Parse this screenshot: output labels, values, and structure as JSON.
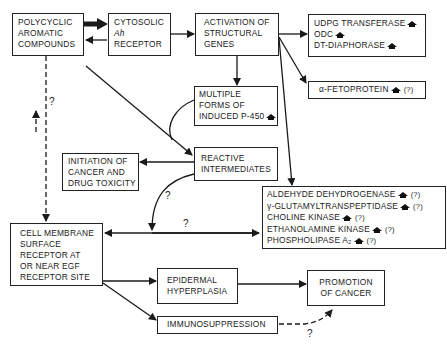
{
  "diagram": {
    "nodes": {
      "pah": {
        "lines": [
          "POLYCYCLIC",
          "AROMATIC",
          "COMPOUNDS"
        ]
      },
      "ah_receptor": {
        "lines": [
          "CYTOSOLIC",
          "Ah",
          "RECEPTOR"
        ]
      },
      "activation": {
        "lines": [
          "ACTIVATION OF",
          "STRUCTURAL",
          "GENES"
        ]
      },
      "enzymes": {
        "items": [
          {
            "label": "UDPG TRANSFERASE",
            "indicator": "increase",
            "note": ""
          },
          {
            "label": "ODC",
            "indicator": "increase",
            "note": ""
          },
          {
            "label": "DT-DIAPHORASE",
            "indicator": "increase",
            "note": ""
          }
        ]
      },
      "afp": {
        "label": "α-FETOPROTEIN",
        "indicator": "increase",
        "note": "(?)"
      },
      "p450": {
        "lines": [
          "MULTIPLE",
          "FORMS OF",
          "INDUCED P-450"
        ],
        "indicator": "increase"
      },
      "reactive": {
        "lines": [
          "REACTIVE",
          "INTERMEDIATES"
        ]
      },
      "initiation": {
        "lines": [
          "INITIATION OF",
          "CANCER AND",
          "DRUG TOXICITY"
        ]
      },
      "enzymes2": {
        "items": [
          {
            "label": "ALDEHYDE DEHYDROGENASE",
            "note": "(?)"
          },
          {
            "label": "γ-GLUTAMYLTRANSPEPTIDASE",
            "note": "(?)"
          },
          {
            "label": "CHOLINE KINASE",
            "note": "(?)"
          },
          {
            "label": "ETHANOLAMINE KINASE",
            "note": "(?)"
          },
          {
            "label": "PHOSPHOLIPASE A₂",
            "note": "(?)"
          }
        ]
      },
      "cell_membrane": {
        "lines": [
          "CELL MEMBRANE",
          "SURFACE",
          "RECEPTOR AT",
          "OR NEAR EGF",
          "RECEPTOR SITE"
        ]
      },
      "epidermal": {
        "lines": [
          "EPIDERMAL",
          "HYPERPLASIA"
        ]
      },
      "promotion": {
        "lines": [
          "PROMOTION",
          "OF CANCER"
        ]
      },
      "immuno": {
        "label": "IMMUNOSUPPRESSION"
      }
    },
    "question_marks": {
      "pah_to_membrane": "?",
      "reactive_to_membrane": "?",
      "membrane_enzymes": "?",
      "immuno_to_promotion": "?"
    },
    "colors": {
      "line": "#1a1a1a",
      "background": "#ffffff"
    }
  }
}
